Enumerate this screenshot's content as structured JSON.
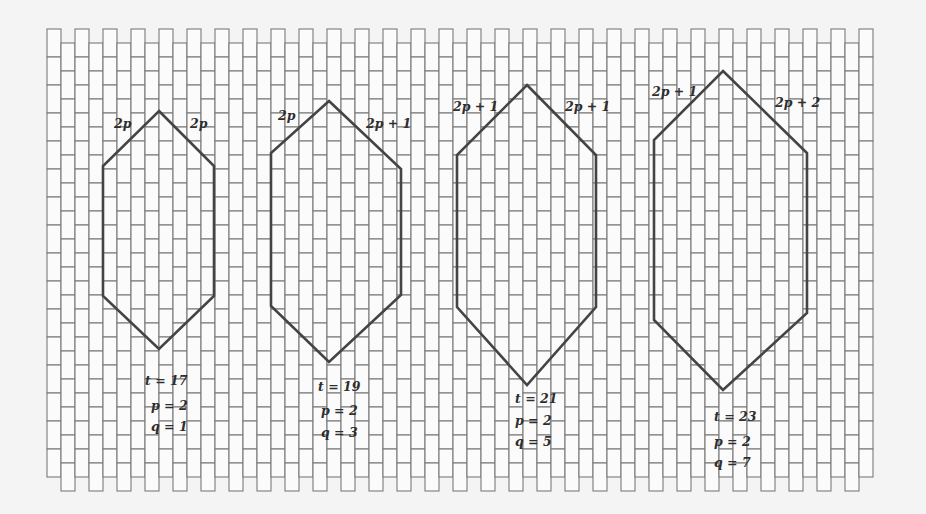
{
  "grid": {
    "x0": 47,
    "y0": 29,
    "col_w": 14,
    "brick_h": 28,
    "cols": 59,
    "rows": 16,
    "line_color": "#7a7a7a",
    "fill": "#fbfbfb"
  },
  "hexagon_style": {
    "stroke": "#444444",
    "stroke_width": 2.6
  },
  "hexagons": [
    {
      "id": "hex-1",
      "points": [
        [
          159,
          111
        ],
        [
          214,
          166
        ],
        [
          214,
          296
        ],
        [
          159,
          349
        ],
        [
          103,
          296
        ],
        [
          103,
          166
        ]
      ],
      "edge_labels": [
        {
          "text": "2p",
          "x": 114,
          "y": 128
        },
        {
          "text": "2p",
          "x": 190,
          "y": 128
        }
      ],
      "params": [
        {
          "text": "t = 17",
          "x": 145,
          "y": 385
        },
        {
          "text": "p = 2",
          "x": 151,
          "y": 410
        },
        {
          "text": "q = 1",
          "x": 151,
          "y": 431
        }
      ]
    },
    {
      "id": "hex-2",
      "points": [
        [
          329,
          101
        ],
        [
          401,
          169
        ],
        [
          401,
          295
        ],
        [
          329,
          362
        ],
        [
          271,
          306
        ],
        [
          271,
          153
        ]
      ],
      "edge_labels": [
        {
          "text": "2p",
          "x": 278,
          "y": 120
        },
        {
          "text": "2p + 1",
          "x": 366,
          "y": 128
        }
      ],
      "params": [
        {
          "text": "t = 19",
          "x": 318,
          "y": 391
        },
        {
          "text": "p = 2",
          "x": 321,
          "y": 415
        },
        {
          "text": "q = 3",
          "x": 321,
          "y": 437
        }
      ]
    },
    {
      "id": "hex-3",
      "points": [
        [
          527,
          85
        ],
        [
          596,
          155
        ],
        [
          596,
          307
        ],
        [
          527,
          385
        ],
        [
          457,
          307
        ],
        [
          457,
          155
        ]
      ],
      "edge_labels": [
        {
          "text": "2p + 1",
          "x": 453,
          "y": 111
        },
        {
          "text": "2p + 1",
          "x": 565,
          "y": 111
        }
      ],
      "params": [
        {
          "text": "t = 21",
          "x": 515,
          "y": 403
        },
        {
          "text": "p = 2",
          "x": 515,
          "y": 425
        },
        {
          "text": "q = 5",
          "x": 515,
          "y": 446
        }
      ]
    },
    {
      "id": "hex-4",
      "points": [
        [
          723,
          71
        ],
        [
          807,
          153
        ],
        [
          807,
          313
        ],
        [
          723,
          390
        ],
        [
          654,
          320
        ],
        [
          654,
          140
        ]
      ],
      "edge_labels": [
        {
          "text": "2p + 1",
          "x": 652,
          "y": 96
        },
        {
          "text": "2p + 2",
          "x": 775,
          "y": 107
        }
      ],
      "params": [
        {
          "text": "t = 23",
          "x": 714,
          "y": 421
        },
        {
          "text": "p = 2",
          "x": 714,
          "y": 446
        },
        {
          "text": "q = 7",
          "x": 714,
          "y": 467
        }
      ]
    }
  ]
}
